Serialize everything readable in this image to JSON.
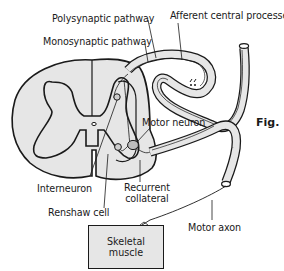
{
  "figure": {
    "fig_label": "Fig.",
    "colors": {
      "background": "#ffffff",
      "tissue_fill": "#e6e6e6",
      "outline": "#1a1a1a"
    }
  },
  "labels": {
    "polysynaptic_pathway": "Polysynaptic pathway",
    "afferent_central_processes": "Afferent central processes",
    "monosynaptic_pathway": "Monosynaptic pathway",
    "motor_neuron": "Motor neuron",
    "interneuron": "Interneuron",
    "recurrent_collateral_line1": "Recurrent",
    "recurrent_collateral_line2": "collateral",
    "renshaw_cell": "Renshaw cell",
    "motor_axon": "Motor axon"
  },
  "muscle": {
    "line1": "Skeletal",
    "line2": "muscle"
  }
}
